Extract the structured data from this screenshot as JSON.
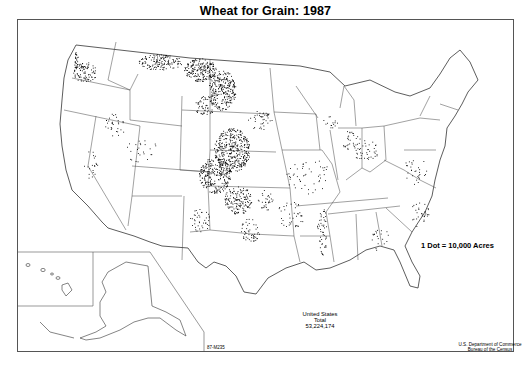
{
  "map": {
    "title": "Wheat for Grain: 1987",
    "legend": {
      "dot_value_label": "1 Dot = 10,000 Acres"
    },
    "total": {
      "line1": "United States",
      "line2": "Total",
      "value": "53,224,174"
    },
    "credit": {
      "line1": "U.S. Department of Commerce",
      "line2": "Bureau of the Census"
    },
    "map_code": "87-M235",
    "insets": [
      "Alaska",
      "Hawaii"
    ],
    "colors": {
      "dots": "#000000",
      "boundaries": "#333333",
      "background": "#ffffff",
      "frame": "#555555"
    }
  }
}
